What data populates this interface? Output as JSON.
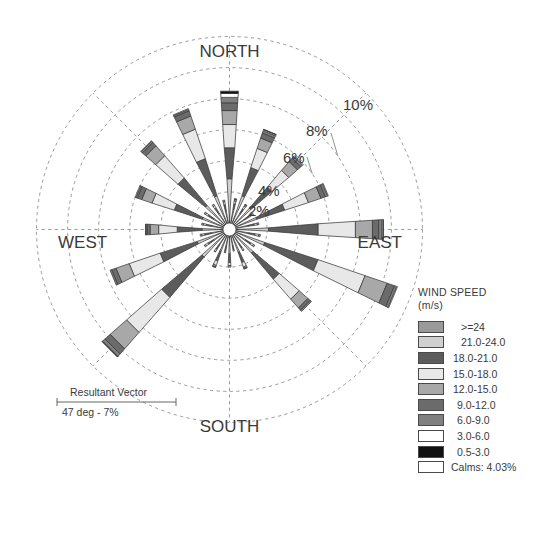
{
  "chart_data": {
    "type": "windrose",
    "compass": {
      "north": "NORTH",
      "east": "EAST",
      "south": "SOUTH",
      "west": "WEST"
    },
    "radial_axis": {
      "unit": "%",
      "tick_labels": [
        "2%",
        "4%",
        "6%",
        "8%",
        "10%"
      ],
      "tick_values": [
        2,
        4,
        6,
        8,
        10
      ],
      "rmax": 12,
      "grid": true,
      "grid_style": "dashed"
    },
    "calms_percent": 4.03,
    "resultant_vector": {
      "caption": "Resultant Vector",
      "value": "47 deg - 7%",
      "direction_deg": 47,
      "magnitude_percent": 7
    },
    "speed_bins": [
      {
        "label": ">=24",
        "color": "#9a9a9a"
      },
      {
        "label": "21.0-24.0",
        "color": "#d0d0d0"
      },
      {
        "label": "18.0-21.0",
        "color": "#5c5c5c"
      },
      {
        "label": "15.0-18.0",
        "color": "#e8e8e8"
      },
      {
        "label": "12.0-15.0",
        "color": "#a8a8a8"
      },
      {
        "label": "9.0-12.0",
        "color": "#6b6b6b"
      },
      {
        "label": "6.0-9.0",
        "color": "#808080"
      },
      {
        "label": "3.0-6.0",
        "color": "#ffffff"
      },
      {
        "label": "0.5-3.0",
        "color": "#111111"
      }
    ],
    "calms_legend_label": "Calms: 4.03%",
    "legend_title_line1": "WIND SPEED",
    "legend_title_line2": "(m/s)",
    "petal_count": 32,
    "petal_angle_step_deg": 11.25,
    "directions": [
      {
        "bearing": 0,
        "name": "N",
        "total": 8.5,
        "segments": [
          0.45,
          2.4,
          2.0,
          1.5,
          0.9,
          0.5,
          0.35,
          0.25,
          0.15
        ]
      },
      {
        "bearing": 11.25,
        "name": "NbE",
        "total": 1.6,
        "segments": [
          0.35,
          0.55,
          0.35,
          0.2,
          0.1,
          0.05,
          0.0,
          0.0,
          0.0
        ]
      },
      {
        "bearing": 22.5,
        "name": "NNE",
        "total": 6.4,
        "segments": [
          0.4,
          1.5,
          1.9,
          1.3,
          0.7,
          0.35,
          0.15,
          0.07,
          0.03
        ]
      },
      {
        "bearing": 33.75,
        "name": "NEbN",
        "total": 1.5,
        "segments": [
          0.3,
          0.5,
          0.35,
          0.2,
          0.1,
          0.05,
          0.0,
          0.0,
          0.0
        ]
      },
      {
        "bearing": 45,
        "name": "NE",
        "total": 5.9,
        "segments": [
          0.35,
          1.1,
          1.8,
          1.4,
          0.75,
          0.3,
          0.15,
          0.05,
          0.0
        ]
      },
      {
        "bearing": 56.25,
        "name": "NEbE",
        "total": 1.4,
        "segments": [
          0.3,
          0.45,
          0.35,
          0.2,
          0.1,
          0.0,
          0.0,
          0.0,
          0.0
        ]
      },
      {
        "bearing": 67.5,
        "name": "ENE",
        "total": 6.3,
        "segments": [
          0.35,
          1.1,
          1.9,
          1.6,
          0.85,
          0.3,
          0.15,
          0.05,
          0.0
        ]
      },
      {
        "bearing": 78.75,
        "name": "EbN",
        "total": 1.5,
        "segments": [
          0.3,
          0.5,
          0.4,
          0.2,
          0.1,
          0.0,
          0.0,
          0.0,
          0.0
        ]
      },
      {
        "bearing": 90,
        "name": "E",
        "total": 9.5,
        "segments": [
          0.4,
          1.7,
          3.2,
          2.4,
          1.1,
          0.4,
          0.2,
          0.08,
          0.02
        ]
      },
      {
        "bearing": 101.25,
        "name": "EbS",
        "total": 1.6,
        "segments": [
          0.3,
          0.55,
          0.4,
          0.25,
          0.1,
          0.0,
          0.0,
          0.0,
          0.0
        ]
      },
      {
        "bearing": 112.5,
        "name": "ESE",
        "total": 11.0,
        "segments": [
          0.4,
          1.6,
          3.6,
          3.2,
          1.5,
          0.5,
          0.15,
          0.05,
          0.0
        ]
      },
      {
        "bearing": 123.75,
        "name": "SEbE",
        "total": 1.5,
        "segments": [
          0.3,
          0.5,
          0.4,
          0.2,
          0.1,
          0.0,
          0.0,
          0.0,
          0.0
        ]
      },
      {
        "bearing": 135,
        "name": "SE",
        "total": 6.6,
        "segments": [
          0.35,
          1.3,
          2.2,
          1.7,
          0.75,
          0.2,
          0.1,
          0.0,
          0.0
        ]
      },
      {
        "bearing": 146.25,
        "name": "SEbS",
        "total": 1.2,
        "segments": [
          0.3,
          0.4,
          0.3,
          0.15,
          0.05,
          0.0,
          0.0,
          0.0,
          0.0
        ]
      },
      {
        "bearing": 157.5,
        "name": "SSE",
        "total": 2.3,
        "segments": [
          0.35,
          0.8,
          0.7,
          0.3,
          0.1,
          0.05,
          0.0,
          0.0,
          0.0
        ]
      },
      {
        "bearing": 168.75,
        "name": "SbE",
        "total": 1.0,
        "segments": [
          0.3,
          0.35,
          0.25,
          0.1,
          0.0,
          0.0,
          0.0,
          0.0,
          0.0
        ]
      },
      {
        "bearing": 180,
        "name": "S",
        "total": 2.0,
        "segments": [
          0.4,
          0.75,
          0.55,
          0.2,
          0.1,
          0.0,
          0.0,
          0.0,
          0.0
        ]
      },
      {
        "bearing": 191.25,
        "name": "SbW",
        "total": 1.1,
        "segments": [
          0.3,
          0.4,
          0.25,
          0.1,
          0.05,
          0.0,
          0.0,
          0.0,
          0.0
        ]
      },
      {
        "bearing": 202.5,
        "name": "SSW",
        "total": 2.2,
        "segments": [
          0.35,
          0.75,
          0.65,
          0.3,
          0.1,
          0.05,
          0.0,
          0.0,
          0.0
        ]
      },
      {
        "bearing": 213.75,
        "name": "SWbS",
        "total": 1.3,
        "segments": [
          0.3,
          0.45,
          0.35,
          0.15,
          0.05,
          0.0,
          0.0,
          0.0,
          0.0
        ]
      },
      {
        "bearing": 225,
        "name": "SW",
        "total": 10.5,
        "segments": [
          0.4,
          1.6,
          3.4,
          3.0,
          1.4,
          0.45,
          0.2,
          0.04,
          0.01
        ]
      },
      {
        "bearing": 236.25,
        "name": "SWbW",
        "total": 1.5,
        "segments": [
          0.3,
          0.5,
          0.4,
          0.2,
          0.1,
          0.0,
          0.0,
          0.0,
          0.0
        ]
      },
      {
        "bearing": 247.5,
        "name": "WSW",
        "total": 7.7,
        "segments": [
          0.4,
          1.4,
          2.5,
          2.1,
          0.9,
          0.3,
          0.1,
          0.0,
          0.0
        ]
      },
      {
        "bearing": 258.75,
        "name": "WbS",
        "total": 1.5,
        "segments": [
          0.3,
          0.5,
          0.4,
          0.2,
          0.1,
          0.0,
          0.0,
          0.0,
          0.0
        ]
      },
      {
        "bearing": 270,
        "name": "W",
        "total": 5.0,
        "segments": [
          0.35,
          1.0,
          1.6,
          1.2,
          0.55,
          0.2,
          0.08,
          0.02,
          0.0
        ]
      },
      {
        "bearing": 281.25,
        "name": "WbN",
        "total": 1.4,
        "segments": [
          0.3,
          0.45,
          0.35,
          0.2,
          0.1,
          0.0,
          0.0,
          0.0,
          0.0
        ]
      },
      {
        "bearing": 292.5,
        "name": "WNW",
        "total": 6.0,
        "segments": [
          0.35,
          1.1,
          1.9,
          1.5,
          0.7,
          0.3,
          0.1,
          0.05,
          0.0
        ]
      },
      {
        "bearing": 303.75,
        "name": "NWbW",
        "total": 1.5,
        "segments": [
          0.3,
          0.5,
          0.4,
          0.2,
          0.1,
          0.0,
          0.0,
          0.0,
          0.0
        ]
      },
      {
        "bearing": 315,
        "name": "NW",
        "total": 7.2,
        "segments": [
          0.4,
          1.3,
          2.3,
          1.9,
          0.85,
          0.3,
          0.1,
          0.05,
          0.0
        ]
      },
      {
        "bearing": 326.25,
        "name": "NWbN",
        "total": 1.5,
        "segments": [
          0.3,
          0.5,
          0.4,
          0.2,
          0.1,
          0.0,
          0.0,
          0.0,
          0.0
        ]
      },
      {
        "bearing": 337.5,
        "name": "NNW",
        "total": 7.8,
        "segments": [
          0.4,
          1.5,
          2.5,
          2.0,
          0.9,
          0.35,
          0.1,
          0.05,
          0.0
        ]
      },
      {
        "bearing": 348.75,
        "name": "NbW",
        "total": 1.5,
        "segments": [
          0.3,
          0.5,
          0.4,
          0.2,
          0.1,
          0.0,
          0.0,
          0.0,
          0.0
        ]
      }
    ]
  },
  "colors": {
    "grid": "#8e8e8e",
    "outline": "#3a3a3a",
    "text": "#3a3a3a",
    "background": "#ffffff"
  }
}
